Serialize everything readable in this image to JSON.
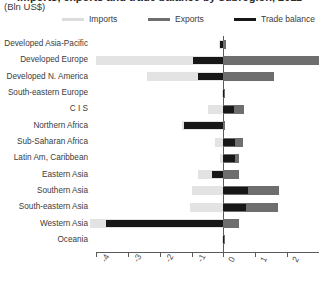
{
  "chart_data": {
    "type": "bar",
    "orientation": "horizontal",
    "title": "Imports, exports and trade balance by subregion, 2011",
    "subtitle": "(Bln US$)",
    "unit_label": "(Bln US$)",
    "xlabel": "",
    "ylabel": "",
    "xlim": [
      -4,
      3
    ],
    "xticks": [
      -4,
      -3,
      -2,
      -1,
      0,
      1,
      2,
      3
    ],
    "xticklabels": [
      "-4",
      "-3",
      "-2",
      "-1",
      "0",
      "1",
      "2",
      "3"
    ],
    "grid": false,
    "legend_position": "top",
    "categories": [
      "Developed Asia-Pacific",
      "Developed Europe",
      "Developed N. America",
      "South-eastern Europe",
      "C I S",
      "Northern Africa",
      "Sub-Saharan Africa",
      "Latin Am, Caribbean",
      "Eastern Asia",
      "Southern Asia",
      "South-eastern Asia",
      "Western Asia",
      "Oceania"
    ],
    "series": [
      {
        "name": "Imports",
        "color": "#e3e3e3",
        "values": [
          -0.15,
          -4.0,
          -2.4,
          -0.05,
          -0.5,
          -1.3,
          -0.25,
          -0.12,
          -0.8,
          -1.0,
          -1.05,
          -4.2,
          -0.03
        ]
      },
      {
        "name": "Exports",
        "color": "#6e6e6e",
        "values": [
          0.08,
          3.05,
          1.6,
          0.04,
          0.65,
          0.05,
          0.62,
          0.48,
          0.5,
          1.75,
          1.7,
          0.5,
          0.02
        ]
      },
      {
        "name": "Trade balance",
        "color": "#171717",
        "values": [
          -0.12,
          -0.95,
          -0.8,
          -0.02,
          0.32,
          -1.25,
          0.36,
          0.36,
          -0.35,
          0.78,
          0.7,
          -3.7,
          -0.01
        ]
      }
    ]
  },
  "legend": {
    "items": [
      {
        "label": "Imports",
        "color": "#dcdcdc"
      },
      {
        "label": "Exports",
        "color": "#6e6e6e"
      },
      {
        "label": "Trade balance",
        "color": "#171717"
      }
    ]
  },
  "colors": {
    "imports": "#e3e3e3",
    "exports": "#6e6e6e",
    "balance": "#171717",
    "axis": "#5a5a5a",
    "text": "#3b3b3b",
    "background": "#ffffff"
  }
}
